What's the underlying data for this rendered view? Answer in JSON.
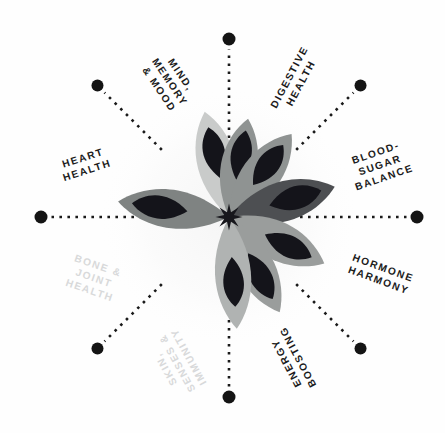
{
  "diagram": {
    "type": "radial-spoke-diagram",
    "background_color": "#fefefe",
    "center": {
      "x": 229,
      "y": 217,
      "icon": "eight-point-star"
    },
    "label_color": "#1b1b1b",
    "faded_label_color": "#d8d9da",
    "spoke_dot_color": "#141414",
    "spoke_dash_color": "#1a1a1a"
  },
  "labels": [
    {
      "id": "mind-memory-mood",
      "text": "MIND,\nMEMORY\n& MOOD",
      "lines": [
        "MIND,",
        "MEMORY",
        "& MOOD"
      ],
      "angle_deg": -56,
      "rotation_deg": 56,
      "x": 170,
      "y": 82,
      "faded": false
    },
    {
      "id": "digestive-health",
      "text": "DIGESTIVE\nHEALTH",
      "lines": [
        "DIGESTIVE",
        "HEALTH"
      ],
      "angle_deg": -28,
      "rotation_deg": -62,
      "x": 295,
      "y": 80,
      "faded": false
    },
    {
      "id": "blood-sugar-balance",
      "text": "BLOOD-\nSUGAR\nBALANCE",
      "lines": [
        "BLOOD-",
        "SUGAR",
        "BALANCE"
      ],
      "angle_deg": -20,
      "rotation_deg": -19,
      "x": 380,
      "y": 165,
      "faded": false
    },
    {
      "id": "hormone-harmony",
      "text": "HORMONE\nHARMONY",
      "lines": [
        "HORMONE",
        "HARMONY"
      ],
      "angle_deg": 20,
      "rotation_deg": 20,
      "x": 381,
      "y": 274,
      "faded": false
    },
    {
      "id": "energy-boosting",
      "text": "ENERGY\nBOOSTING",
      "lines": [
        "ENERGY",
        "BOOSTING"
      ],
      "angle_deg": 60,
      "rotation_deg": 242,
      "x": 292,
      "y": 360,
      "faded": false
    },
    {
      "id": "skin-senses-immunity",
      "text": "SKIN,\nSENSES &\nIMMUNITY",
      "lines": [
        "SKIN,",
        "SENSES &",
        "IMMUNITY"
      ],
      "angle_deg": 118,
      "rotation_deg": 241,
      "x": 177,
      "y": 363,
      "faded": true
    },
    {
      "id": "bone-joint-health",
      "text": "BONE &\nJOINT\nHEALTH",
      "lines": [
        "BONE &",
        "JOINT",
        "HEALTH"
      ],
      "angle_deg": 155,
      "rotation_deg": 19,
      "x": 94,
      "y": 278,
      "faded": true
    },
    {
      "id": "heart-health",
      "text": "HEART\nHEALTH",
      "lines": [
        "HEART",
        "HEALTH"
      ],
      "angle_deg": -160,
      "rotation_deg": -18,
      "x": 85,
      "y": 164,
      "faded": false
    }
  ],
  "spokes": [
    {
      "id": "spoke-top",
      "angle_deg": -90,
      "inner_r": 55,
      "outer_r": 178,
      "dot_r": 6.5
    },
    {
      "id": "spoke-upper-right",
      "angle_deg": -45,
      "inner_r": 95,
      "outer_r": 186,
      "dot_r": 6.0
    },
    {
      "id": "spoke-right",
      "angle_deg": 0,
      "inner_r": 55,
      "outer_r": 188,
      "dot_r": 6.5
    },
    {
      "id": "spoke-lower-right",
      "angle_deg": 45,
      "inner_r": 95,
      "outer_r": 186,
      "dot_r": 6.0
    },
    {
      "id": "spoke-bottom",
      "angle_deg": 90,
      "inner_r": 55,
      "outer_r": 180,
      "dot_r": 6.5
    },
    {
      "id": "spoke-lower-left",
      "angle_deg": 135,
      "inner_r": 95,
      "outer_r": 186,
      "dot_r": 6.0
    },
    {
      "id": "spoke-left",
      "angle_deg": 180,
      "inner_r": 55,
      "outer_r": 188,
      "dot_r": 6.5
    },
    {
      "id": "spoke-upper-left",
      "angle_deg": -135,
      "inner_r": 95,
      "outer_r": 186,
      "dot_r": 6.0
    }
  ],
  "flower": {
    "center_star_color": "#17171c",
    "petals": [
      {
        "id": "petal-up-left",
        "angle_deg": -103,
        "length": 108,
        "width": 30,
        "fill": "#c9cbca",
        "inner_fill": "#14141a",
        "inner_length": 52,
        "inner_width": 17,
        "inner_offset": 40
      },
      {
        "id": "petal-up",
        "angle_deg": -79,
        "length": 100,
        "width": 28,
        "fill": "#8f9392",
        "inner_fill": "#14141a",
        "inner_length": 50,
        "inner_width": 16,
        "inner_offset": 38
      },
      {
        "id": "petal-up-right",
        "angle_deg": -53,
        "length": 104,
        "width": 30,
        "fill": "#8f9392",
        "inner_fill": "#14141a",
        "inner_length": 50,
        "inner_width": 17,
        "inner_offset": 40
      },
      {
        "id": "petal-right-upper",
        "angle_deg": -16,
        "length": 110,
        "width": 31,
        "fill": "#4d4f52",
        "inner_fill": "#14141a",
        "inner_length": 54,
        "inner_width": 18,
        "inner_offset": 42
      },
      {
        "id": "petal-right-lower",
        "angle_deg": 26,
        "length": 106,
        "width": 30,
        "fill": "#9a9d9c",
        "inner_fill": "#14141a",
        "inner_length": 52,
        "inner_width": 17,
        "inner_offset": 40
      },
      {
        "id": "petal-down-right",
        "angle_deg": 62,
        "length": 108,
        "width": 29,
        "fill": "#9a9d9c",
        "inner_fill": "#14141a",
        "inner_length": 52,
        "inner_width": 17,
        "inner_offset": 41
      },
      {
        "id": "petal-down",
        "angle_deg": 86,
        "length": 112,
        "width": 28,
        "fill": "#b0b3b2",
        "inner_fill": "#14141a",
        "inner_length": 50,
        "inner_width": 16,
        "inner_offset": 40
      },
      {
        "id": "petal-left",
        "angle_deg": 188,
        "length": 112,
        "width": 30,
        "fill": "#7f8382",
        "inner_fill": "#14141a",
        "inner_length": 56,
        "inner_width": 18,
        "inner_offset": 42
      }
    ]
  }
}
